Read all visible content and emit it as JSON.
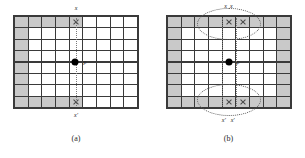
{
  "figure": {
    "panels": [
      {
        "id": "a",
        "caption": "(a)",
        "center_point_label": "p",
        "top_label": "x",
        "bottom_label": "x'",
        "grid": {
          "columns": 9,
          "rows": 8
        },
        "marked_cells": [
          {
            "row": 0,
            "col": 4
          },
          {
            "row": 7,
            "col": 4
          }
        ],
        "shaded_cells_note": "left column and upper/lower-left cells shaded gray",
        "ellipses": []
      },
      {
        "id": "b",
        "caption": "(b)",
        "center_point_label": "p",
        "top_labels": [
          "x",
          "x"
        ],
        "bottom_labels": [
          "x'",
          "x'"
        ],
        "grid": {
          "columns": 9,
          "rows": 8
        },
        "marked_cells": [
          {
            "row": 0,
            "col": 4
          },
          {
            "row": 0,
            "col": 5
          },
          {
            "row": 7,
            "col": 4
          },
          {
            "row": 7,
            "col": 5
          }
        ],
        "shaded_cells_note": "full perimeter ring shaded gray",
        "ellipses": [
          "top",
          "bottom"
        ]
      }
    ],
    "colors": {
      "grid_line": "#3a3a3a",
      "cell_shaded": "#c9c9c9",
      "cell_empty": "#ffffff",
      "center_dot": "#000000",
      "dotted_guide": "#7a7a7a",
      "ellipse_outline": "#5a5a5a"
    }
  }
}
